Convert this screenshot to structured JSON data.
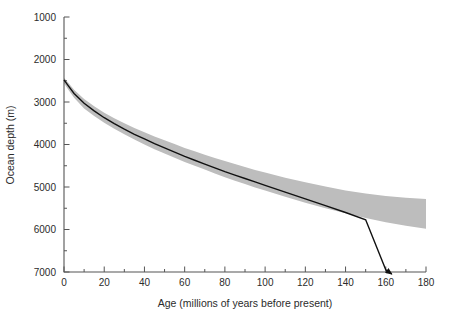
{
  "chart_data": {
    "type": "line",
    "title": "",
    "xlabel": "Age (millions of years before present)",
    "ylabel": "Ocean depth (m)",
    "xlim": [
      0,
      180
    ],
    "ylim": [
      1000,
      7000
    ],
    "y_inverted": true,
    "grid": false,
    "legend": null,
    "x_major_ticks": [
      0,
      20,
      40,
      60,
      80,
      100,
      120,
      140,
      160,
      180
    ],
    "x_minor_ticks": [
      10,
      30,
      50,
      70,
      90,
      110,
      130,
      150,
      170
    ],
    "y_major_ticks": [
      1000,
      2000,
      3000,
      4000,
      5000,
      6000,
      7000
    ],
    "y_minor_ticks": [
      1500,
      2500,
      3500,
      4500,
      5500,
      6500
    ],
    "x_tick_labels": [
      "0",
      "20",
      "40",
      "60",
      "80",
      "100",
      "120",
      "140",
      "160",
      "180"
    ],
    "y_tick_labels": [
      "1000",
      "2000",
      "3000",
      "4000",
      "5000",
      "6000",
      "7000"
    ],
    "series": [
      {
        "name": "Half-space cooling model curve",
        "kind": "line",
        "style": "solid",
        "color": "#111111",
        "arrow_end": true,
        "x": [
          0,
          2,
          5,
          10,
          15,
          20,
          25,
          30,
          35,
          40,
          45,
          50,
          55,
          60,
          65,
          70,
          75,
          80,
          85,
          90,
          95,
          100,
          110,
          120,
          130,
          140,
          150,
          160,
          163
        ],
        "y": [
          2480,
          2610,
          2800,
          3030,
          3210,
          3370,
          3510,
          3640,
          3760,
          3870,
          3980,
          4080,
          4180,
          4280,
          4370,
          4460,
          4550,
          4640,
          4720,
          4800,
          4880,
          4960,
          5120,
          5280,
          5440,
          5600,
          5770,
          6950,
          7050
        ]
      },
      {
        "name": "Observed bathymetry envelope",
        "kind": "band",
        "color": "#bdbdbd",
        "x": [
          0,
          2,
          5,
          10,
          15,
          20,
          25,
          30,
          35,
          40,
          45,
          50,
          55,
          60,
          65,
          70,
          75,
          80,
          85,
          90,
          95,
          100,
          110,
          120,
          130,
          140,
          150,
          160,
          170,
          180
        ],
        "y_upper": [
          2430,
          2540,
          2710,
          2930,
          3100,
          3250,
          3380,
          3500,
          3610,
          3710,
          3810,
          3900,
          3990,
          4080,
          4160,
          4240,
          4320,
          4390,
          4460,
          4530,
          4600,
          4660,
          4780,
          4890,
          4990,
          5080,
          5150,
          5210,
          5250,
          5280
        ],
        "y_lower": [
          2560,
          2700,
          2900,
          3150,
          3330,
          3490,
          3630,
          3760,
          3880,
          4000,
          4110,
          4210,
          4310,
          4410,
          4500,
          4590,
          4680,
          4770,
          4850,
          4930,
          5010,
          5080,
          5230,
          5370,
          5500,
          5620,
          5730,
          5830,
          5910,
          5980
        ]
      }
    ],
    "annotations": [
      {
        "text": "arrow terminus of model curve",
        "x": 163,
        "y": 7050
      }
    ],
    "colors": {
      "band": "#bdbdbd",
      "curve": "#111111",
      "axis": "#555555",
      "text": "#2b2b2b",
      "background": "#ffffff"
    }
  },
  "geometry": {
    "plot_left": 64,
    "plot_right": 426,
    "plot_top": 17,
    "plot_bottom": 272
  }
}
